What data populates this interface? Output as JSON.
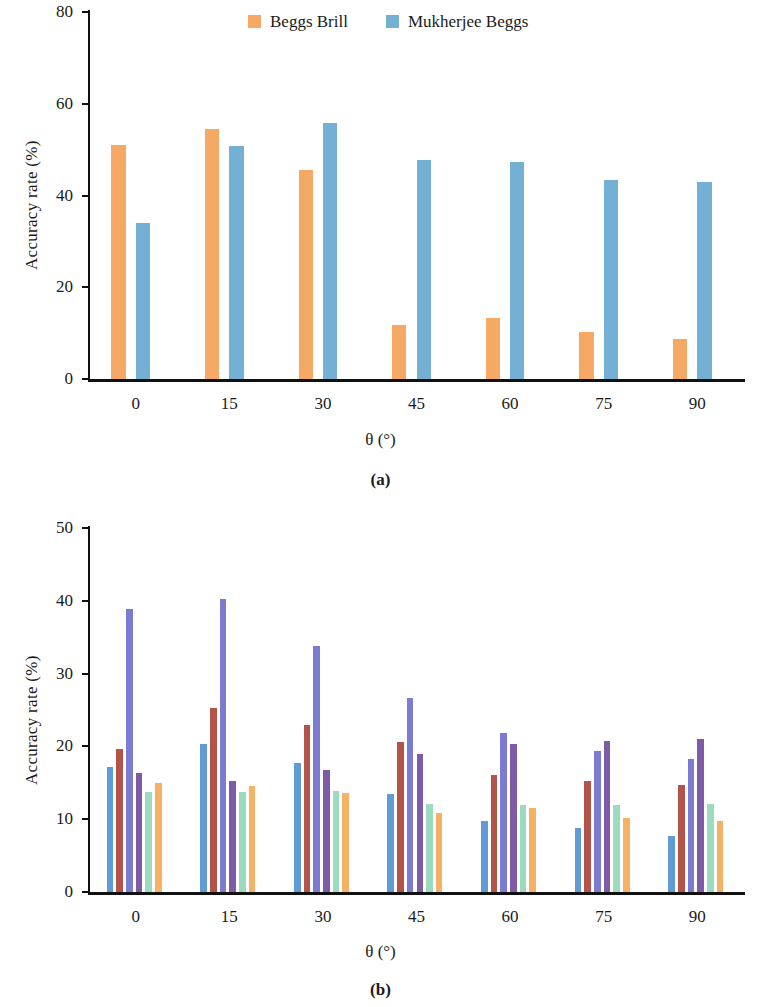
{
  "figure": {
    "panels": [
      {
        "id": "a",
        "caption": "(a)"
      },
      {
        "id": "b",
        "caption": "(b)"
      }
    ]
  },
  "chart_data": [
    {
      "type": "bar",
      "panel": "a",
      "title": "",
      "xlabel": "θ (°)",
      "ylabel": "Accuracy rate (%)",
      "categories": [
        "0",
        "15",
        "30",
        "45",
        "60",
        "75",
        "90"
      ],
      "xticks": [
        "0",
        "15",
        "30",
        "45",
        "60",
        "75",
        "90"
      ],
      "yticks": [
        "0",
        "20",
        "40",
        "60",
        "80"
      ],
      "ylim": [
        0,
        80
      ],
      "grid": false,
      "legend_position": "top-center",
      "series": [
        {
          "name": "Beggs Brill",
          "color": "#F5A964",
          "values": [
            51.1,
            54.6,
            45.6,
            11.8,
            13.4,
            10.3,
            8.7
          ]
        },
        {
          "name": "Mukherjee Beggs",
          "color": "#74AFD4",
          "values": [
            34.0,
            50.9,
            55.7,
            47.7,
            47.3,
            43.4,
            42.9
          ]
        }
      ]
    },
    {
      "type": "bar",
      "panel": "b",
      "title": "",
      "xlabel": "θ (°)",
      "ylabel": "Accuracy rate (%)",
      "categories": [
        "0",
        "15",
        "30",
        "45",
        "60",
        "75",
        "90"
      ],
      "xticks": [
        "0",
        "15",
        "30",
        "45",
        "60",
        "75",
        "90"
      ],
      "yticks": [
        "0",
        "10",
        "20",
        "30",
        "40",
        "50"
      ],
      "ylim": [
        0,
        50
      ],
      "grid": false,
      "legend_position": "top-right",
      "series": [
        {
          "name": "Beggs Brill",
          "color": "#619BD6",
          "values": [
            17.2,
            20.4,
            17.7,
            13.4,
            9.8,
            8.8,
            7.7
          ]
        },
        {
          "name": "Mukherjee Beggs",
          "color": "#B25449",
          "values": [
            19.6,
            25.3,
            22.9,
            20.6,
            16.1,
            15.3,
            14.7
          ]
        },
        {
          "name": "Aziz",
          "color": "#7B7BD2",
          "values": [
            38.9,
            40.2,
            33.8,
            26.7,
            21.9,
            19.4,
            18.3
          ]
        },
        {
          "name": "Hasan",
          "color": "#7E5BA6",
          "values": [
            16.3,
            15.3,
            16.7,
            19.0,
            20.4,
            20.8,
            21.0
          ]
        },
        {
          "name": "JPI",
          "color": "#9BDCC0",
          "values": [
            13.8,
            13.7,
            13.9,
            12.1,
            12.0,
            12.0,
            12.1
          ]
        },
        {
          "name": "Orkiszewski",
          "color": "#F5B263",
          "values": [
            15.0,
            14.6,
            13.6,
            10.9,
            11.5,
            10.2,
            9.8
          ]
        }
      ]
    }
  ]
}
